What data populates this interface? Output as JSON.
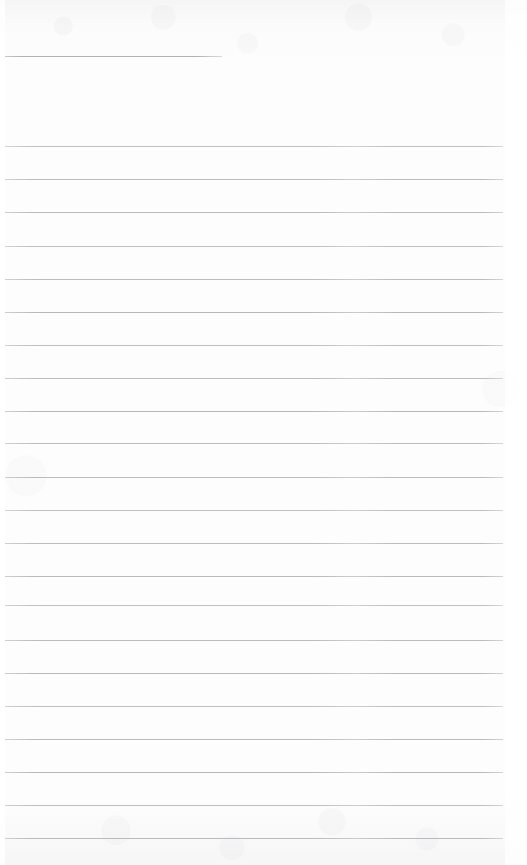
{
  "page": {
    "kind": "scanned-lined-notebook-page",
    "width": 527,
    "height": 865,
    "background_color": "#fdfdfd",
    "rule_color": "#b6b6ba",
    "header_rule_color": "#b0b0b5",
    "text_content": "",
    "has_handwriting": false,
    "has_printed_text": false
  },
  "rules": {
    "header": {
      "label": "header-rule",
      "x": 5,
      "y": 56,
      "width": 217,
      "thickness": 1
    },
    "body_x": 5,
    "body_width": 498,
    "body_thickness": 1,
    "count": 22,
    "spacing": 33.3,
    "body_y": [
      146,
      179,
      212,
      246,
      279,
      312,
      345,
      378,
      411,
      443,
      477,
      510,
      543,
      576,
      605,
      640,
      673,
      706,
      739,
      772,
      805,
      838
    ]
  },
  "margins": {
    "left_edge_label": "left-edge-margin",
    "right_edge_label": "right-edge-margin",
    "footer_label": "footer-blank-area"
  }
}
